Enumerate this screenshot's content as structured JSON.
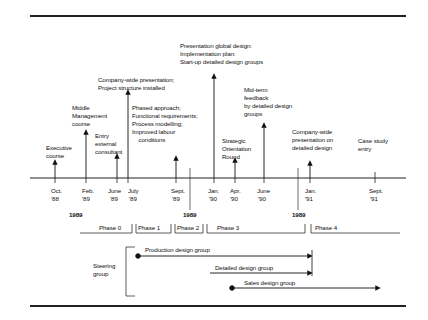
{
  "timeline": {
    "ticks": [
      {
        "id": "oct88",
        "x": 55,
        "month": "Oct.",
        "year": "'88"
      },
      {
        "id": "feb89",
        "x": 86,
        "month": "Feb.",
        "year": "'89"
      },
      {
        "id": "jun89",
        "x": 117,
        "month": "June",
        "year": "'89"
      },
      {
        "id": "jul89",
        "x": 128,
        "month": "July",
        "year": "'89"
      },
      {
        "id": "sep89",
        "x": 176,
        "month": "Sept.",
        "year": "'89"
      },
      {
        "id": "jan90",
        "x": 214,
        "month": "Jan.",
        "year": "'90"
      },
      {
        "id": "apr90",
        "x": 235,
        "month": "Apr.",
        "year": "'90"
      },
      {
        "id": "jun90",
        "x": 264,
        "month": "June",
        "year": "'90"
      },
      {
        "id": "jan91",
        "x": 310,
        "month": "Jan.",
        "year": "'91"
      },
      {
        "id": "sep91",
        "x": 375,
        "month": "Sept.",
        "year": "'91"
      }
    ],
    "events": [
      {
        "id": "executive",
        "text": "Executive\ncourse"
      },
      {
        "id": "middle-mgmt",
        "text": "Middle\nManagement\ncourse"
      },
      {
        "id": "entry-consultant",
        "text": "Entry\nexternal\nconsultant"
      },
      {
        "id": "company-wide-1",
        "text": "Company-wide presentation;\nProject structure installed"
      },
      {
        "id": "phased",
        "text": "Phased approach;\nFunctional requirements;\nProcess modelling;\nImproved labour\n    conditions"
      },
      {
        "id": "global-design",
        "text": "Presentation global design:\nImplementation plan:\nStart-up detailed design groups"
      },
      {
        "id": "strategic",
        "text": "Strategic\nOrientation\nRound"
      },
      {
        "id": "midterm",
        "text": "Mid-term\nfeedback\nby detailed design\ngroups"
      },
      {
        "id": "company-wide-2",
        "text": "Company-wide\npresentation on\ndetailed design"
      },
      {
        "id": "case-study",
        "text": "Case study\nentry"
      }
    ],
    "year_markers": [
      "1989",
      "1989",
      "1989"
    ]
  },
  "phases": [
    "Phase 0",
    "Phase 1",
    "Phase 2",
    "Phase 3",
    "Phase 4"
  ],
  "groups": {
    "steering": "Steering\ngroup",
    "production": "Production design group",
    "detailed": "Detailed design group",
    "sales": "Sales design group"
  }
}
